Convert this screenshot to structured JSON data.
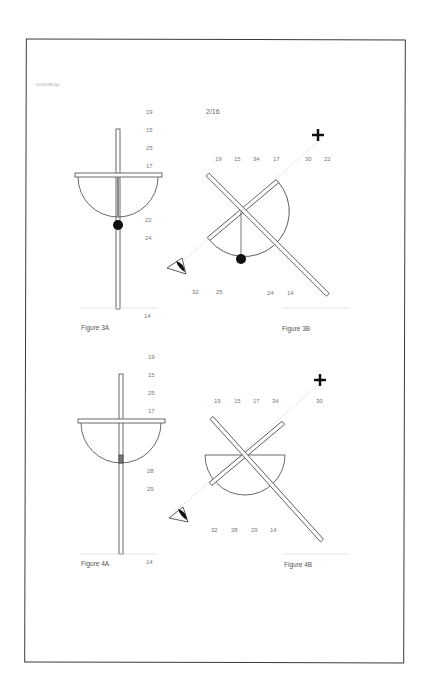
{
  "header": {
    "doc_ref": "DCSS.P86.0p1",
    "sheet": "2/16"
  },
  "figures": {
    "fig3a": {
      "caption": "Figure 3A",
      "labels": {
        "l19": "19",
        "l15": "15",
        "l25": "25",
        "l17": "17",
        "l22": "22",
        "l24": "24",
        "l14": "14"
      }
    },
    "fig3b": {
      "caption": "Figure 3B",
      "labels": {
        "l19": "19",
        "l15": "15",
        "l34": "34",
        "l17": "17",
        "l30": "30",
        "l22": "22",
        "l32": "32",
        "l25": "25",
        "l24": "24",
        "l14": "14"
      }
    },
    "fig4a": {
      "caption": "Figure 4A",
      "labels": {
        "l19": "19",
        "l15": "15",
        "l25": "25",
        "l17": "17",
        "l28": "28",
        "l29": "29",
        "l14": "14"
      }
    },
    "fig4b": {
      "caption": "Figure 4B",
      "labels": {
        "l19": "19",
        "l15": "15",
        "l17": "17",
        "l34": "34",
        "l30": "30",
        "l32": "32",
        "l28": "28",
        "l29": "29",
        "l14": "14"
      }
    }
  },
  "colors": {
    "line": "#444444",
    "leader": "#cccccc",
    "border": "#3a3a3a"
  }
}
